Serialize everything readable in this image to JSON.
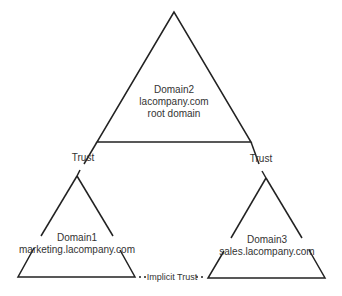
{
  "diagram": {
    "root_domain": {
      "name": "Domain2",
      "dns": "lacompany.com",
      "role": "root domain"
    },
    "child_left": {
      "name": "Domain1",
      "dns": "marketing.lacompany.com"
    },
    "child_right": {
      "name": "Domain3",
      "dns": "sales.lacompany.com"
    },
    "trust_left_label": "Trust",
    "trust_right_label": "Trust",
    "implicit_trust_label": "Implicit Trust"
  },
  "colors": {
    "line": "#222222",
    "text": "#333333",
    "background": "#ffffff"
  }
}
